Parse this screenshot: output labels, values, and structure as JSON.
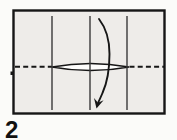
{
  "step": {
    "label": "2"
  },
  "colors": {
    "background": "#fbfbf9",
    "paper_fill": "#eeece9",
    "ink": "#161616",
    "crease": "#3a3a3a",
    "lens_fill": "#fdfdfc"
  },
  "diagram": {
    "type": "origami-step",
    "paper": {
      "x": 13.5,
      "y": 10.5,
      "width": 151,
      "height": 103,
      "border_width": 2.4
    },
    "vertical_creases": {
      "xs": [
        52,
        90,
        127
      ],
      "y1": 16,
      "y2": 110,
      "width": 1.4
    },
    "valley_fold": {
      "y": 66.8,
      "segments": [
        [
          15,
          52
        ],
        [
          129.5,
          164.5
        ]
      ],
      "dash": "5 3.2",
      "width": 2.1
    },
    "lens": {
      "x1": 52,
      "x2": 129,
      "cy": 67,
      "half_height": 3.6,
      "outline_width": 1.5
    },
    "arrow": {
      "path": "M 99 19 C 106 28 109.5 40 109.5 54 C 109.5 68 107.5 82 102.5 93 C 101 96.5 99.8 99.3 98.3 102.3",
      "width": 1.9,
      "head": {
        "tip": [
          96.5,
          108.5
        ],
        "left": [
          94,
          98
        ],
        "notch": [
          98,
          102.8
        ],
        "right": [
          103.6,
          100.3
        ]
      }
    },
    "speck": {
      "x": 10.5,
      "y": 71.5,
      "w": 3,
      "h": 3.5
    }
  }
}
